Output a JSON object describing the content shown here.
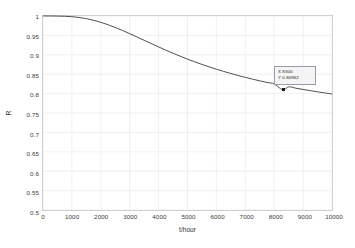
{
  "chart_data": {
    "type": "line",
    "title": "",
    "xlabel": "t/hour",
    "ylabel": "R",
    "xlim": [
      0,
      10000
    ],
    "ylim": [
      0.5,
      1
    ],
    "grid": true,
    "legend": null,
    "xticks": [
      "0",
      "1000",
      "2000",
      "3000",
      "4000",
      "5000",
      "6000",
      "7000",
      "8000",
      "9000",
      "10000"
    ],
    "xtick_values": [
      0,
      1000,
      2000,
      3000,
      4000,
      5000,
      6000,
      7000,
      8000,
      9000,
      10000
    ],
    "yticks": [
      "0.5",
      "0.55",
      "0.6",
      "0.65",
      "0.7",
      "0.75",
      "0.8",
      "0.85",
      "0.9",
      "0.95",
      "1"
    ],
    "ytick_values": [
      0.5,
      0.55,
      0.6,
      0.65,
      0.7,
      0.75,
      0.8,
      0.85,
      0.9,
      0.95,
      1
    ],
    "series": [
      {
        "name": "R(t)",
        "color": "#3c3c3c",
        "x": [
          0,
          250,
          500,
          750,
          1000,
          1250,
          1500,
          1750,
          2000,
          2250,
          2500,
          2750,
          3000,
          3250,
          3500,
          3750,
          4000,
          4250,
          4500,
          4750,
          5000,
          5250,
          5500,
          5750,
          6000,
          6250,
          6500,
          6750,
          7000,
          7250,
          7500,
          7750,
          8000,
          8300,
          8500,
          8750,
          9000,
          9250,
          9500,
          9750,
          10000
        ],
        "y": [
          1.0,
          1.0,
          0.9998,
          0.9993,
          0.9982,
          0.9962,
          0.9932,
          0.989,
          0.9838,
          0.9775,
          0.9704,
          0.9627,
          0.9545,
          0.946,
          0.9374,
          0.9288,
          0.9203,
          0.912,
          0.904,
          0.8963,
          0.8889,
          0.8819,
          0.8752,
          0.8689,
          0.8629,
          0.8572,
          0.8518,
          0.8467,
          0.8419,
          0.8373,
          0.8329,
          0.8288,
          0.8248,
          0.8096,
          0.8174,
          0.814,
          0.8107,
          0.8076,
          0.8046,
          0.8017,
          0.799
        ]
      }
    ],
    "annotations": [
      {
        "type": "datatip",
        "x_label": "X 8300",
        "y_label": "Y 0.80962",
        "x_value": 8300,
        "y_value": 0.80962
      }
    ]
  }
}
